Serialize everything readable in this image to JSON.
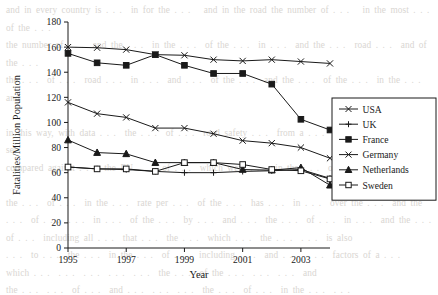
{
  "page": {
    "background_text": "and in every country is . . .  in for the . . .   and in the road the number of . . .   in the most . . .  of the . . .\nthe number of . . .  and the . . .  in the . . .  of the . . .  in . . .  and the . . .  road . . .  and of the . . .\nthe . . .  of . . .  road . . .  in . . .  and . . .  of the . . .  and the . . .  of the . . .  in the . . .  and\n\nin this way, with data . . .  the . . .  of . . .  road safety . . .  from a . . .  of . . .  the . . .  data sets\ncompared against . . .  the EU . . .  of . . .  which were . . .  in the . . .  of the . . .  year . . .\n\nthe . . .  of . . .  in the . . .  rate per . . .  of the . . .  has . . .  in . . .  over the . . .  and the\n. . .  of . . .  . . .  in . . .  of the . . .  by . . .  and . . .  the . . .  of . . .  in . . .  and the . . .\nof . . .  including all . . .  that . . .  the . . .  which . . .  the . . .  . . .  is also\n. . .  to . . .  the . . .  in the . . .  of . . .  including . . .  and . . .  . . .  factors of a . . .\nwhich . . .  . . .  . . .  . . .  . . .  the . . .  of the . . .  . . .  . . .  and\nthe . . .  . . .  of . . .  and . . .  . . .  . . .  the . . .  of . . .  in the . . .  . . .\n. . .  the . . .  . . .  . . .  the . . .  of the . . .  . . .  . . .  . . .\n                                                                         . . .  . . .  . . .  . . ."
  },
  "chart_data": {
    "type": "line",
    "title": "",
    "xlabel": "Year",
    "ylabel": "Fatalities/Million Population",
    "x": [
      1995,
      1996,
      1997,
      1998,
      1999,
      2000,
      2001,
      2002,
      2003,
      2004
    ],
    "xlim": [
      1995,
      2004
    ],
    "ylim": [
      0,
      180
    ],
    "xticks": [
      1995,
      1997,
      1999,
      2001,
      2003
    ],
    "xtick_labels": [
      "1995",
      "1997",
      "1999",
      "2001",
      "2003"
    ],
    "yticks": [
      0,
      20,
      40,
      60,
      80,
      100,
      120,
      140,
      160,
      180
    ],
    "ytick_labels": [
      "0",
      "20",
      "40",
      "60",
      "80",
      "100",
      "120",
      "140",
      "160",
      "180"
    ],
    "grid": false,
    "legend_position": "right",
    "series": [
      {
        "name": "USA",
        "marker": "x",
        "values": [
          160,
          159.5,
          158,
          154,
          153.5,
          150,
          149,
          150,
          148.5,
          147
        ]
      },
      {
        "name": "UK",
        "marker": "plus",
        "values": [
          64.5,
          63,
          62.5,
          61,
          60,
          60,
          61,
          61.5,
          62.5,
          55.5
        ]
      },
      {
        "name": "France",
        "marker": "square-filled",
        "values": [
          155,
          147.5,
          145.5,
          154,
          145.5,
          139,
          139,
          130.5,
          102.5,
          94
        ]
      },
      {
        "name": "Germany",
        "marker": "x",
        "values": [
          116,
          107,
          104,
          95.5,
          95.5,
          91,
          85.5,
          83.5,
          80,
          71.5
        ]
      },
      {
        "name": "Netherlands",
        "marker": "triangle-filled",
        "values": [
          86,
          76,
          75,
          68,
          68,
          68,
          62.5,
          62,
          64,
          50
        ]
      },
      {
        "name": "Sweden",
        "marker": "square-open",
        "values": [
          64.5,
          63,
          63,
          61,
          68,
          68,
          66.5,
          62.5,
          61.5,
          55
        ]
      }
    ]
  },
  "colors": {
    "ink": "#1a1a1a",
    "paper": "#ffffff",
    "ghost_text": "#d9d6d2"
  }
}
